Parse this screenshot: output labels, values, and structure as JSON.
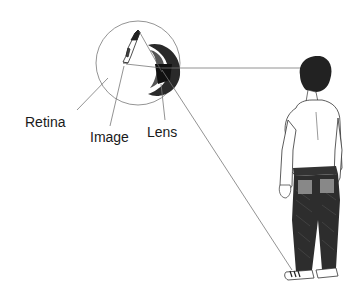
{
  "diagram": {
    "title": "",
    "labels": {
      "retina": "Retina",
      "image": "Image",
      "lens": "Lens"
    },
    "components": [
      "eye",
      "inverted-image-on-retina",
      "lens",
      "standing-person",
      "light-rays"
    ],
    "colors": {
      "ink": "#1a1a1a",
      "line": "#555555",
      "background": "#ffffff"
    }
  }
}
